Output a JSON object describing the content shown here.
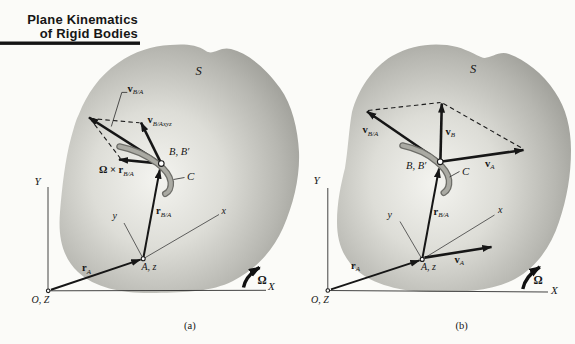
{
  "title": {
    "line1": "Plane Kinematics",
    "line2": "of Rigid Bodies"
  },
  "colors": {
    "page_bg": "#fbfbf8",
    "body_edge": "#9c9c96",
    "body_center": "#f4f4f0",
    "ink": "#161616"
  },
  "figures": {
    "a": {
      "caption": "(a)",
      "body_label": "S",
      "labels": {
        "v_BA": {
          "base": "v",
          "sub": "B/A"
        },
        "v_Bxyz": {
          "base": "v",
          "sub": "B/Axyz"
        },
        "omega_cross": {
          "pre": "Ω ×",
          "base": "r",
          "sub": "B/A"
        },
        "r_BA": {
          "base": "r",
          "sub": "B/A"
        },
        "r_A": {
          "base": "r",
          "sub": "A"
        },
        "point_B": "B, B′",
        "curve": "C",
        "point_A": "A, z",
        "origin": "O, Z",
        "axis_Y": "Y",
        "axis_X": "X",
        "axis_x": "x",
        "axis_y": "y",
        "omega": "Ω"
      }
    },
    "b": {
      "caption": "(b)",
      "body_label": "S",
      "labels": {
        "v_BA": {
          "base": "v",
          "sub": "B/A"
        },
        "v_B": {
          "base": "v",
          "sub": "B"
        },
        "v_A": {
          "base": "v",
          "sub": "A"
        },
        "r_BA": {
          "base": "r",
          "sub": "B/A"
        },
        "r_A": {
          "base": "r",
          "sub": "A"
        },
        "point_B": "B, B′",
        "curve": "C",
        "point_A": "A, z",
        "origin": "O, Z",
        "axis_Y": "Y",
        "axis_X": "X",
        "axis_x": "x",
        "axis_y": "y",
        "omega": "Ω"
      }
    }
  }
}
